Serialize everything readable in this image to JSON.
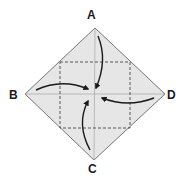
{
  "diagram": {
    "type": "origami-fold-step",
    "labels": {
      "top": "A",
      "left": "B",
      "bottom": "C",
      "right": "D"
    },
    "colors": {
      "paper": "#e6e6e6",
      "outline": "#555555",
      "dashed": "#333333",
      "crease": "#9a9a9a",
      "arrow": "#1a1a1a",
      "label": "#1a1a1a"
    }
  }
}
